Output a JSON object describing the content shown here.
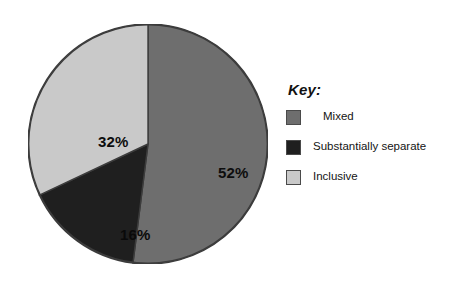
{
  "chart_data": {
    "type": "pie",
    "title": "",
    "legend_position": "right",
    "categories": [
      "Mixed",
      "Substantially separate",
      "Inclusive"
    ],
    "values": [
      52,
      16,
      32
    ],
    "value_labels": [
      "52%",
      "16%",
      "32%"
    ],
    "colors": [
      "#6e6e6e",
      "#1f1f1f",
      "#c9c9c9"
    ],
    "start_angle_deg": 0,
    "direction": "clockwise",
    "units": "percent",
    "slices": [
      {
        "label": "Mixed",
        "value": 52,
        "display": "52%",
        "color": "#6e6e6e"
      },
      {
        "label": "Substantially separate",
        "value": 16,
        "display": "16%",
        "color": "#1f1f1f"
      },
      {
        "label": "Inclusive",
        "value": 32,
        "display": "32%",
        "color": "#c9c9c9"
      }
    ]
  },
  "legend": {
    "title": "Key:",
    "items": [
      {
        "label": "Mixed",
        "color": "#6e6e6e"
      },
      {
        "label": "Substantially separate",
        "color": "#1f1f1f"
      },
      {
        "label": "Inclusive",
        "color": "#c9c9c9"
      }
    ]
  },
  "style": {
    "background": "#ffffff",
    "outline": "#3c3c3c",
    "label_color": "#0d0d0d"
  }
}
